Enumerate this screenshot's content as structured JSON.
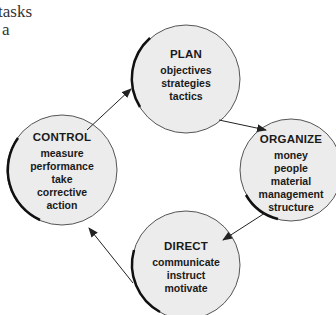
{
  "text_fragment": {
    "line1": "tasks",
    "line2": "a"
  },
  "diagram": {
    "type": "cycle",
    "colors": {
      "circle_fill": "#ececec",
      "stroke": "#111111",
      "arrow": "#222222"
    },
    "nodes": [
      {
        "id": "plan",
        "title": "PLAN",
        "items": [
          "objectives",
          "strategies",
          "tactics"
        ]
      },
      {
        "id": "organize",
        "title": "ORGANIZE",
        "items": [
          "money",
          "people",
          "material",
          "management",
          "structure"
        ]
      },
      {
        "id": "direct",
        "title": "DIRECT",
        "items": [
          "communicate",
          "instruct",
          "motivate"
        ]
      },
      {
        "id": "control",
        "title": "CONTROL",
        "items": [
          "measure",
          "performance",
          "take",
          "corrective",
          "action"
        ]
      }
    ],
    "edges": [
      {
        "from": "plan",
        "to": "organize"
      },
      {
        "from": "organize",
        "to": "direct"
      },
      {
        "from": "direct",
        "to": "control"
      },
      {
        "from": "control",
        "to": "plan"
      }
    ]
  }
}
